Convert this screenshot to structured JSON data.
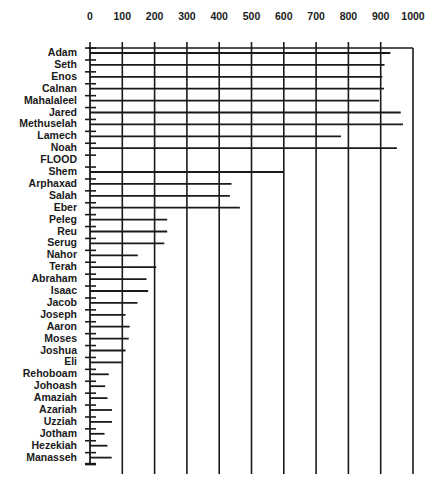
{
  "chart_data": {
    "type": "bar",
    "orientation": "horizontal",
    "title": "",
    "xlabel": "",
    "ylabel": "",
    "xlim": [
      0,
      1000
    ],
    "x_ticks": [
      0,
      100,
      200,
      300,
      400,
      500,
      600,
      700,
      800,
      900,
      1000
    ],
    "x_axis_position": "top",
    "grid": true,
    "legend": null,
    "categories": [
      "Adam",
      "Seth",
      "Enos",
      "Calnan",
      "Mahalaleel",
      "Jared",
      "Methuselah",
      "Lamech",
      "Noah",
      "FLOOD",
      "Shem",
      "Arphaxad",
      "Salah",
      "Eber",
      "Peleg",
      "Reu",
      "Serug",
      "Nahor",
      "Terah",
      "Abraham",
      "Isaac",
      "Jacob",
      "Joseph",
      "Aaron",
      "Moses",
      "Joshua",
      "Eli",
      "Rehoboam",
      "Johoash",
      "Amaziah",
      "Azariah",
      "Uzziah",
      "Jotham",
      "Hezekiah",
      "Manasseh"
    ],
    "values": [
      930,
      912,
      905,
      910,
      895,
      962,
      969,
      777,
      950,
      null,
      600,
      438,
      433,
      464,
      239,
      239,
      230,
      148,
      205,
      175,
      180,
      147,
      110,
      123,
      120,
      110,
      98,
      58,
      47,
      54,
      68,
      68,
      45,
      54,
      67
    ],
    "series": [
      {
        "name": "Lifespan (years)",
        "color": "#1a1a1a"
      }
    ]
  },
  "style": {
    "ink": "#1a1a1a",
    "background": "#ffffff"
  }
}
